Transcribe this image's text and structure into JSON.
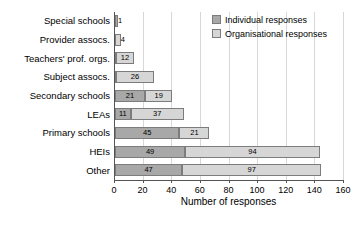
{
  "chart_data": {
    "type": "bar",
    "orientation": "horizontal",
    "stacked": true,
    "title": "",
    "xlabel": "Number of responses",
    "ylabel": "",
    "xlim": [
      0,
      160
    ],
    "xticks": [
      0,
      20,
      40,
      60,
      80,
      100,
      120,
      140,
      160
    ],
    "grid": true,
    "legend_position": "top-right",
    "categories": [
      "Special schools",
      "Provider assocs.",
      "Teachers' prof. orgs.",
      "Subject assocs.",
      "Secondary schools",
      "LEAs",
      "Primary schools",
      "HEIs",
      "Other"
    ],
    "series": [
      {
        "name": "Individual responses",
        "color": "#a8a8a8",
        "values": [
          1,
          0,
          1,
          1,
          21,
          11,
          45,
          49,
          47
        ]
      },
      {
        "name": "Organisational responses",
        "color": "#d6d6d6",
        "values": [
          0,
          4,
          12,
          26,
          19,
          37,
          21,
          94,
          97
        ]
      }
    ],
    "bar_labels": [
      [
        "1",
        ""
      ],
      [
        "",
        "4"
      ],
      [
        "1",
        "12"
      ],
      [
        "1",
        "26"
      ],
      [
        "21",
        "19"
      ],
      [
        "11",
        "37"
      ],
      [
        "45",
        "21"
      ],
      [
        "49",
        "94"
      ],
      [
        "47",
        "97"
      ]
    ]
  },
  "legend": {
    "items": [
      {
        "label": "Individual responses",
        "swatch": "individual"
      },
      {
        "label": "Organisational responses",
        "swatch": "organisational"
      }
    ]
  }
}
